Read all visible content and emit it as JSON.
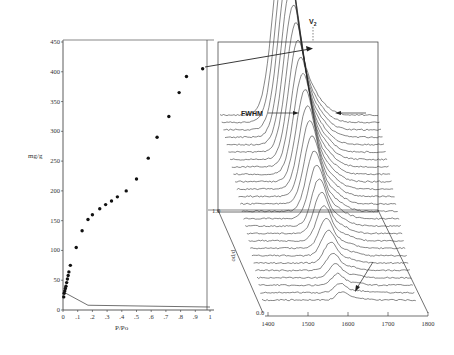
{
  "chart_data": [
    {
      "type": "scatter",
      "title": "",
      "xlabel": "P/Po",
      "ylabel": "mg/g",
      "xlim": [
        0,
        1
      ],
      "ylim": [
        0,
        450
      ],
      "x_ticks": [
        "0",
        ".1",
        ".2",
        ".3",
        ".4",
        ".5",
        ".6",
        ".7",
        ".8",
        ".9",
        "1"
      ],
      "y_ticks": [
        "0",
        "50",
        "100",
        "150",
        "200",
        "250",
        "300",
        "350",
        "400",
        "450"
      ],
      "grid": false,
      "series": [
        {
          "name": "adsorption isotherm",
          "x": [
            0.005,
            0.008,
            0.012,
            0.016,
            0.02,
            0.025,
            0.03,
            0.035,
            0.04,
            0.05,
            0.09,
            0.13,
            0.17,
            0.2,
            0.25,
            0.29,
            0.33,
            0.37,
            0.43,
            0.5,
            0.58,
            0.64,
            0.72,
            0.79,
            0.84,
            0.95
          ],
          "y": [
            22,
            28,
            32,
            36,
            40,
            46,
            52,
            58,
            64,
            75,
            105,
            133,
            152,
            160,
            170,
            177,
            183,
            190,
            200,
            220,
            255,
            290,
            325,
            365,
            392,
            405
          ]
        },
        {
          "name": "baseline line",
          "type": "line",
          "x": [
            0.02,
            0.17,
            1.0
          ],
          "y": [
            28,
            8,
            5
          ]
        }
      ]
    },
    {
      "type": "line",
      "title": "",
      "annotations": [
        "V2",
        "FWHM"
      ],
      "xlabel": "",
      "ylabel": "p/po",
      "x_ticks": [
        "1400",
        "1500",
        "1600",
        "1700",
        "1800"
      ],
      "xlim": [
        1400,
        1800
      ],
      "depth_axis_ticks": [
        "0.0",
        "1.0"
      ],
      "description": "Waterfall (stacked) spectra vs wavenumber, peak near 1600-1650 shifting to ~1530 at high p/po",
      "series_count": 26
    }
  ],
  "left": {
    "ylabel": "mg/g",
    "xlabel": "P/Po"
  },
  "right": {
    "peak_label": "V",
    "peak_sub": "2",
    "fwhm_label": "FWHM",
    "depth_label": "p/po",
    "depth_top": "1.0",
    "depth_bottom": "0.0"
  }
}
